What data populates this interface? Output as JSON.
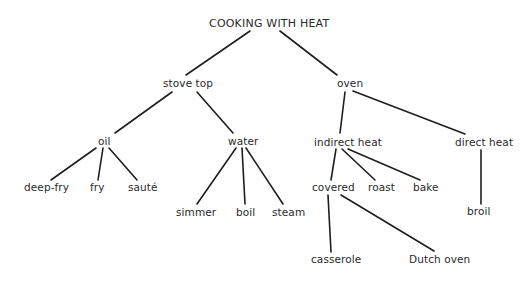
{
  "diagram": {
    "type": "tree",
    "title": "COOKING WITH HEAT",
    "nodes": {
      "root": {
        "label": "COOKING WITH HEAT",
        "x": 209,
        "y": 18
      },
      "stove_top": {
        "label": "stove top",
        "x": 163,
        "y": 77
      },
      "oven": {
        "label": "oven",
        "x": 337,
        "y": 77
      },
      "oil": {
        "label": "oil",
        "x": 98,
        "y": 135
      },
      "water": {
        "label": "water",
        "x": 228,
        "y": 135
      },
      "indirect_heat": {
        "label": "indirect heat",
        "x": 314,
        "y": 136
      },
      "direct_heat": {
        "label": "direct heat",
        "x": 455,
        "y": 136
      },
      "deep_fry": {
        "label": "deep-fry",
        "x": 24,
        "y": 181
      },
      "fry": {
        "label": "fry",
        "x": 90,
        "y": 181
      },
      "saute": {
        "label": "sauté",
        "x": 128,
        "y": 181
      },
      "simmer": {
        "label": "simmer",
        "x": 176,
        "y": 206
      },
      "boil": {
        "label": "boil",
        "x": 236,
        "y": 206
      },
      "steam": {
        "label": "steam",
        "x": 272,
        "y": 206
      },
      "covered": {
        "label": "covered",
        "x": 312,
        "y": 181
      },
      "roast": {
        "label": "roast",
        "x": 368,
        "y": 181
      },
      "bake": {
        "label": "bake",
        "x": 413,
        "y": 181
      },
      "broil": {
        "label": "broil",
        "x": 467,
        "y": 205
      },
      "casserole": {
        "label": "casserole",
        "x": 311,
        "y": 253
      },
      "dutch_oven": {
        "label": "Dutch oven",
        "x": 409,
        "y": 253
      }
    },
    "edges": [
      {
        "from": "root",
        "to": "stove_top",
        "x1": 250,
        "y1": 31,
        "x2": 186,
        "y2": 75
      },
      {
        "from": "root",
        "to": "oven",
        "x1": 280,
        "y1": 31,
        "x2": 337,
        "y2": 75
      },
      {
        "from": "stove_top",
        "to": "oil",
        "x1": 172,
        "y1": 92,
        "x2": 115,
        "y2": 133
      },
      {
        "from": "stove_top",
        "to": "water",
        "x1": 197,
        "y1": 92,
        "x2": 233,
        "y2": 133
      },
      {
        "from": "oven",
        "to": "indirect_heat",
        "x1": 345,
        "y1": 92,
        "x2": 340,
        "y2": 133
      },
      {
        "from": "oven",
        "to": "direct_heat",
        "x1": 353,
        "y1": 91,
        "x2": 465,
        "y2": 134
      },
      {
        "from": "oil",
        "to": "deep_fry",
        "x1": 96,
        "y1": 148,
        "x2": 51,
        "y2": 180
      },
      {
        "from": "oil",
        "to": "fry",
        "x1": 103,
        "y1": 148,
        "x2": 98,
        "y2": 180
      },
      {
        "from": "oil",
        "to": "saute",
        "x1": 109,
        "y1": 148,
        "x2": 137,
        "y2": 180
      },
      {
        "from": "water",
        "to": "simmer",
        "x1": 236,
        "y1": 148,
        "x2": 197,
        "y2": 204
      },
      {
        "from": "water",
        "to": "boil",
        "x1": 242,
        "y1": 148,
        "x2": 245,
        "y2": 204
      },
      {
        "from": "water",
        "to": "steam",
        "x1": 246,
        "y1": 148,
        "x2": 283,
        "y2": 204
      },
      {
        "from": "indirect_heat",
        "to": "covered",
        "x1": 336,
        "y1": 149,
        "x2": 331,
        "y2": 180
      },
      {
        "from": "indirect_heat",
        "to": "roast",
        "x1": 342,
        "y1": 149,
        "x2": 375,
        "y2": 180
      },
      {
        "from": "indirect_heat",
        "to": "bake",
        "x1": 348,
        "y1": 149,
        "x2": 420,
        "y2": 180
      },
      {
        "from": "direct_heat",
        "to": "broil",
        "x1": 481,
        "y1": 150,
        "x2": 481,
        "y2": 204
      },
      {
        "from": "covered",
        "to": "casserole",
        "x1": 328,
        "y1": 195,
        "x2": 331,
        "y2": 252
      },
      {
        "from": "covered",
        "to": "dutch_oven",
        "x1": 341,
        "y1": 195,
        "x2": 434,
        "y2": 251
      }
    ]
  },
  "colors": {
    "background": "#ffffff",
    "line": "#1e1e1e",
    "text": "#2a2a2a"
  }
}
